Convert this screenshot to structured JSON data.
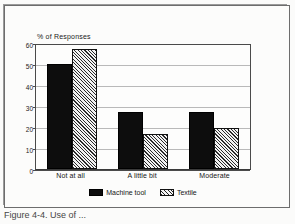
{
  "chart_data": {
    "type": "bar",
    "title": "",
    "ylabel": "% of Responses",
    "xlabel": "",
    "ylim": [
      0,
      60
    ],
    "yticks": [
      0,
      10,
      20,
      30,
      40,
      50,
      60
    ],
    "grid": true,
    "legend_position": "bottom",
    "categories": [
      "Not at all",
      "A little bit",
      "Moderate"
    ],
    "series": [
      {
        "name": "Machine tool",
        "pattern": "solid-black",
        "values": [
          50,
          27,
          27
        ]
      },
      {
        "name": "Textile",
        "pattern": "diagonal-hatch",
        "values": [
          57,
          16.5,
          19.5
        ]
      }
    ]
  },
  "axis": {
    "y_label": "% of Responses",
    "y_ticks": [
      "60",
      "50",
      "40",
      "30",
      "20",
      "10",
      "0"
    ]
  },
  "categories": [
    {
      "label": "Not at all"
    },
    {
      "label": "A little bit"
    },
    {
      "label": "Moderate"
    }
  ],
  "legend": [
    {
      "label": "Machine tool"
    },
    {
      "label": "Textile"
    }
  ],
  "caption": {
    "text": "Figure 4-4.  Use of ..."
  }
}
